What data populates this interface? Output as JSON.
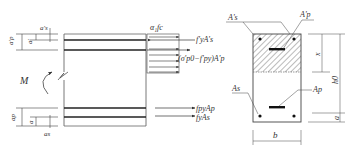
{
  "diagram": {
    "left_dims": {
      "top_outer": "a'",
      "top_s": "a's",
      "top_p": "a'p",
      "bottom_outer": "a",
      "bottom_s": "as",
      "bottom_p": "ap"
    },
    "moment_label": "M",
    "forces": {
      "concrete_block": "α₁fc",
      "top_steel": "f'yA's",
      "top_prestress": "(σ'p0−f'py)A'p",
      "bottom_prestress": "fpyAp",
      "bottom_steel": "fyAs"
    },
    "section": {
      "top_steel_label": "A's",
      "top_prestress_label": "A'p",
      "bottom_steel_label": "As",
      "bottom_prestress_label": "Ap",
      "width_label": "b",
      "depth_x_label": "x",
      "eff_depth_label": "h0",
      "cover_label": "a"
    }
  }
}
